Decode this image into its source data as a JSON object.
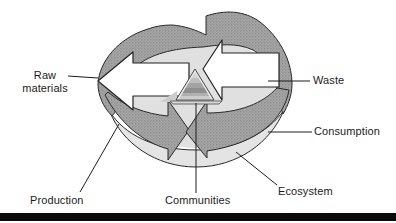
{
  "diagram": {
    "title_implicit": "industrial-ecology-cycle",
    "labels": {
      "raw_materials_line1": "Raw",
      "raw_materials_line2": "materials",
      "waste": "Waste",
      "consumption": "Consumption",
      "ecosystem": "Ecosystem",
      "communities": "Communities",
      "production": "Production"
    },
    "icons": {
      "cycle_band": "circular-gray-band-arrows",
      "raw_materials_arrow": "white-arrow-pointing-left-out",
      "waste_arrow": "white-arrow-pointing-left-in",
      "communities_pyramid": "stepped-pyramid"
    },
    "colors": {
      "band_gray": "#a6a6a6",
      "band_dot": "#787878",
      "disk_top": "#e0e0e0",
      "disk_front": "#e4e4e4",
      "arrow_white": "#ffffff",
      "outline": "#2a2a2a",
      "footer_bar": "#0b0b0b",
      "label_text": "#1b1b1b"
    }
  }
}
